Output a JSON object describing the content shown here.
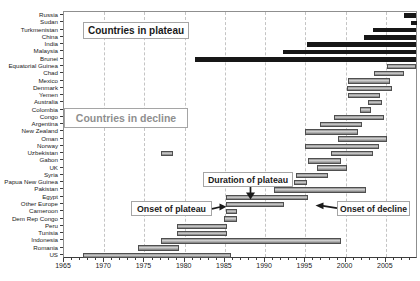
{
  "chart_data": {
    "type": "bar",
    "orientation": "horizontal",
    "variant": "country-span-gantt",
    "title": "",
    "xlabel": "",
    "ylabel": "",
    "unit": "year",
    "xlim": [
      1965,
      2009
    ],
    "x_ticks": [
      1965,
      1970,
      1975,
      1980,
      1985,
      1990,
      1995,
      2000,
      2005
    ],
    "minor_tick_interval": 1,
    "grid": "dashed-vertical",
    "legend_position": "none",
    "groups": [
      "plateau",
      "decline"
    ],
    "rows": [
      {
        "name": "Russia",
        "group": "plateau",
        "spans": [
          [
            2007.2,
            2008.8
          ]
        ]
      },
      {
        "name": "Sudan",
        "group": "plateau",
        "spans": [
          [
            2008.1,
            2008.9
          ]
        ]
      },
      {
        "name": "Turkmenistan",
        "group": "plateau",
        "spans": [
          [
            2003.4,
            2008.8
          ]
        ]
      },
      {
        "name": "China",
        "group": "plateau",
        "spans": [
          [
            2002.3,
            2008.8
          ]
        ]
      },
      {
        "name": "India",
        "group": "plateau",
        "spans": [
          [
            1995.2,
            2008.8
          ]
        ]
      },
      {
        "name": "Malaysia",
        "group": "plateau",
        "spans": [
          [
            1992.2,
            2008.8
          ]
        ]
      },
      {
        "name": "Brunei",
        "group": "plateau",
        "spans": [
          [
            1981.3,
            2008.8
          ]
        ]
      },
      {
        "name": "Equatorial Guinea",
        "group": "decline",
        "spans": [
          [
            2005.2,
            2008.8
          ]
        ]
      },
      {
        "name": "Chad",
        "group": "decline",
        "spans": [
          [
            2003.5,
            2007.3
          ]
        ]
      },
      {
        "name": "Mexico",
        "group": "decline",
        "spans": [
          [
            2000.3,
            2005.5
          ]
        ]
      },
      {
        "name": "Denmark",
        "group": "decline",
        "spans": [
          [
            2000.2,
            2005.8
          ]
        ]
      },
      {
        "name": "Yemen",
        "group": "decline",
        "spans": [
          [
            2000.3,
            2004.3
          ]
        ]
      },
      {
        "name": "Australia",
        "group": "decline",
        "spans": [
          [
            2002.8,
            2004.5
          ]
        ]
      },
      {
        "name": "Colombia",
        "group": "decline",
        "spans": [
          [
            2001.8,
            2003.2
          ]
        ]
      },
      {
        "name": "Congo",
        "group": "decline",
        "spans": [
          [
            1998.5,
            2004.8
          ]
        ]
      },
      {
        "name": "Argentina",
        "group": "decline",
        "spans": [
          [
            1996.8,
            2002.0
          ]
        ]
      },
      {
        "name": "New Zealand",
        "group": "decline",
        "spans": [
          [
            1994.9,
            2001.5
          ]
        ]
      },
      {
        "name": "Oman",
        "group": "decline",
        "spans": [
          [
            1999.0,
            2005.2
          ]
        ]
      },
      {
        "name": "Norway",
        "group": "decline",
        "spans": [
          [
            1994.9,
            2004.1
          ]
        ]
      },
      {
        "name": "Uzbekistan",
        "group": "decline",
        "spans": [
          [
            1977.0,
            1978.6
          ],
          [
            1998.2,
            2003.4
          ]
        ]
      },
      {
        "name": "Gabon",
        "group": "decline",
        "spans": [
          [
            1995.3,
            1999.4
          ]
        ]
      },
      {
        "name": "UK",
        "group": "decline",
        "spans": [
          [
            1996.5,
            2000.2
          ]
        ]
      },
      {
        "name": "Syria",
        "group": "decline",
        "spans": [
          [
            1993.8,
            1997.8
          ]
        ]
      },
      {
        "name": "Papua New Guinea",
        "group": "decline",
        "spans": [
          [
            1993.6,
            1995.2
          ]
        ]
      },
      {
        "name": "Pakistan",
        "group": "decline",
        "spans": [
          [
            1991.1,
            2002.5
          ]
        ]
      },
      {
        "name": "Egypt",
        "group": "decline",
        "spans": [
          [
            1985.1,
            1995.3
          ]
        ]
      },
      {
        "name": "Other Europe",
        "group": "decline",
        "spans": [
          [
            1985.1,
            1992.4
          ]
        ]
      },
      {
        "name": "Cameroon",
        "group": "decline",
        "spans": [
          [
            1985.1,
            1986.5
          ]
        ]
      },
      {
        "name": "Dem Rep Congo",
        "group": "decline",
        "spans": [
          [
            1984.9,
            1986.5
          ]
        ]
      },
      {
        "name": "Peru",
        "group": "decline",
        "spans": [
          [
            1979.1,
            1985.3
          ]
        ]
      },
      {
        "name": "Tunisia",
        "group": "decline",
        "spans": [
          [
            1979.0,
            1985.3
          ]
        ]
      },
      {
        "name": "Indonesia",
        "group": "decline",
        "spans": [
          [
            1977.0,
            1999.4
          ]
        ]
      },
      {
        "name": "Romania",
        "group": "decline",
        "spans": [
          [
            1974.2,
            1979.3
          ]
        ]
      },
      {
        "name": "US",
        "group": "decline",
        "spans": [
          [
            1967.3,
            1985.7
          ]
        ]
      }
    ]
  },
  "annotations": {
    "countries_in_plateau": "Countries in plateau",
    "countries_in_decline": "Countries in decline",
    "duration_of_plateau": "Duration of plateau",
    "onset_of_plateau": "Onset of plateau",
    "onset_of_decline": "Onset of decline"
  },
  "colors": {
    "plateau_bar": "#171717",
    "decline_border": "#4f4f4f",
    "grid": "#c4c4c4",
    "frame": "#8f8f8f",
    "axis": "#3c3c3c",
    "text": "#1a1a1a",
    "muted_text": "#8f8f8f",
    "note_border": "#a5a5a5",
    "arrow": "#1a1a1a"
  }
}
